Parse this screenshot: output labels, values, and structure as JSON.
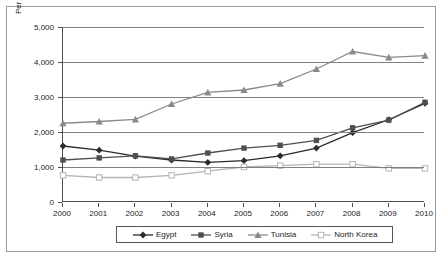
{
  "chart_data": {
    "type": "line",
    "title": "",
    "xlabel": "",
    "ylabel": "Per capita GDP/GNI ($US)",
    "categories": [
      "2000",
      "2001",
      "2002",
      "2003",
      "2004",
      "2005",
      "2006",
      "2007",
      "2008",
      "2009",
      "2010"
    ],
    "x": [
      2000,
      2001,
      2002,
      2003,
      2004,
      2005,
      2006,
      2007,
      2008,
      2009,
      2010
    ],
    "ylim": [
      0,
      5000
    ],
    "ytick_labels": [
      "0",
      "1,000",
      "2,000",
      "3,000",
      "4,000",
      "5,000"
    ],
    "ytick_values": [
      0,
      1000,
      2000,
      3000,
      4000,
      5000
    ],
    "grid": true,
    "legend_position": "bottom",
    "series": [
      {
        "name": "Egypt",
        "marker": "diamond",
        "color": "#2b2b2b",
        "values": [
          1600,
          1480,
          1310,
          1200,
          1130,
          1180,
          1320,
          1540,
          1980,
          2350,
          2820
        ]
      },
      {
        "name": "Syria",
        "marker": "square",
        "color": "#4f4f4f",
        "values": [
          1200,
          1260,
          1320,
          1230,
          1400,
          1540,
          1620,
          1760,
          2120,
          2340,
          2850
        ]
      },
      {
        "name": "Tunisia",
        "marker": "triangle",
        "color": "#8a8a8a",
        "values": [
          2250,
          2300,
          2360,
          2800,
          3130,
          3200,
          3380,
          3800,
          4300,
          4130,
          4180
        ]
      },
      {
        "name": "North Korea",
        "marker": "open-square",
        "color": "#b5b5b5",
        "values": [
          760,
          700,
          700,
          760,
          880,
          1000,
          1040,
          1080,
          1080,
          960,
          960
        ]
      }
    ]
  }
}
